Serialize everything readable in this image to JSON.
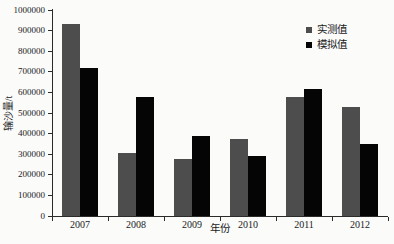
{
  "figure": {
    "xlabel": "年份",
    "ylabel": "输沙量/t",
    "background_color": "#fbfbfa",
    "axis_color": "#2b2b2b"
  },
  "chart_data": {
    "type": "bar",
    "title": "",
    "xlabel": "年份",
    "ylabel": "输沙量/t",
    "categories": [
      "2007",
      "2008",
      "2009",
      "2010",
      "2011",
      "2012"
    ],
    "series": [
      {
        "name": "实测值",
        "color": "#4d4d4d",
        "values": [
          930000,
          305000,
          275000,
          375000,
          580000,
          530000
        ]
      },
      {
        "name": "模拟值",
        "color": "#050505",
        "values": [
          720000,
          580000,
          390000,
          290000,
          615000,
          350000
        ]
      }
    ],
    "ylim": [
      0,
      1000000
    ],
    "ytick_step": 100000,
    "ytick_labels": [
      "0",
      "100000",
      "200000",
      "300000",
      "400000",
      "500000",
      "600000",
      "700000",
      "800000",
      "900000",
      "1000000"
    ],
    "grid": false,
    "legend_position": "upper-right-inside"
  }
}
